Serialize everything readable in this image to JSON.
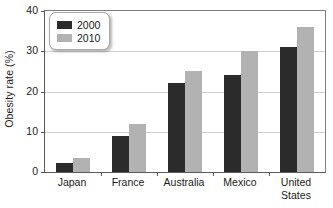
{
  "chart_data": {
    "type": "bar",
    "title": "",
    "subtitle": "",
    "xlabel": "",
    "ylabel": "Obesity rate (%)",
    "categories": [
      "Japan",
      "France",
      "Australia",
      "Mexico",
      "United\nStates"
    ],
    "series": [
      {
        "name": "2000",
        "color": "#2b2b2b",
        "values": [
          2.3,
          9.0,
          22.0,
          24.0,
          31.0
        ]
      },
      {
        "name": "2010",
        "color": "#b2b2b2",
        "values": [
          3.5,
          12.0,
          25.0,
          30.0,
          36.0
        ]
      }
    ],
    "ylim": [
      0,
      40
    ],
    "yticks": [
      0,
      10,
      20,
      30,
      40
    ],
    "ytick_labels": [
      "0",
      "10",
      "20",
      "30",
      "40"
    ],
    "grid": true,
    "grid_axis": "y",
    "legend_position": "upper left",
    "legend_entries": [
      {
        "label": "2000",
        "color": "#2b2b2b"
      },
      {
        "label": "2010",
        "color": "#b2b2b2"
      }
    ]
  },
  "axes": {
    "y_title": "Obesity rate (%)",
    "axis_color": "#5a5a5a",
    "grid_color": "#cfcfcf"
  },
  "legend": {
    "rows": [
      {
        "label": "2000"
      },
      {
        "label": "2010"
      }
    ]
  }
}
